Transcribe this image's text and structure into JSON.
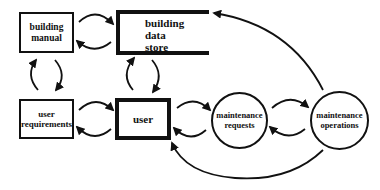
{
  "diagram": {
    "nodes": {
      "building_manual": {
        "line1": "building",
        "line2": "manual"
      },
      "building_data_store": {
        "line1": "building",
        "line2": "data",
        "line3": "store"
      },
      "user_requirements": {
        "line1": "user",
        "line2": "requirements"
      },
      "user": {
        "label": "user"
      },
      "maintenance_requests": {
        "line1": "maintenance",
        "line2": "requests"
      },
      "maintenance_operations": {
        "line1": "maintenance",
        "line2": "operations"
      }
    },
    "edges": [
      {
        "from": "building manual",
        "to": "building data store"
      },
      {
        "from": "building data store",
        "to": "building manual"
      },
      {
        "from": "building manual",
        "to": "user requirements"
      },
      {
        "from": "user requirements",
        "to": "building manual"
      },
      {
        "from": "building data store",
        "to": "user"
      },
      {
        "from": "user",
        "to": "building data store"
      },
      {
        "from": "user requirements",
        "to": "user"
      },
      {
        "from": "user",
        "to": "user requirements"
      },
      {
        "from": "user",
        "to": "maintenance requests"
      },
      {
        "from": "maintenance requests",
        "to": "user"
      },
      {
        "from": "maintenance requests",
        "to": "maintenance operations"
      },
      {
        "from": "maintenance operations",
        "to": "maintenance requests"
      },
      {
        "from": "maintenance operations",
        "to": "building data store"
      },
      {
        "from": "maintenance operations",
        "to": "user"
      }
    ]
  }
}
